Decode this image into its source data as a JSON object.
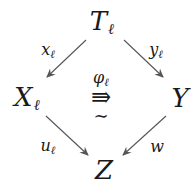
{
  "diagram": {
    "type": "commutative-square-2cell",
    "nodes": {
      "top": {
        "main": "T",
        "sub": "ℓ"
      },
      "left": {
        "main": "X",
        "sub": "ℓ"
      },
      "right": {
        "main": "Y",
        "sub": ""
      },
      "bottom": {
        "main": "Z",
        "sub": ""
      }
    },
    "arrows": [
      {
        "from": "top",
        "to": "left",
        "label_main": "x",
        "label_sub": "ℓ"
      },
      {
        "from": "top",
        "to": "right",
        "label_main": "y",
        "label_sub": "ℓ"
      },
      {
        "from": "left",
        "to": "bottom",
        "label_main": "u",
        "label_sub": "ℓ"
      },
      {
        "from": "right",
        "to": "bottom",
        "label_main": "w",
        "label_sub": ""
      }
    ],
    "two_cell": {
      "label_main": "φ",
      "label_sub": "ℓ",
      "symbol": "⇛",
      "decoration": "∼"
    },
    "colors": {
      "ink": "#1a1a1a",
      "arrow": "#555555",
      "background": "#ffffff"
    }
  }
}
